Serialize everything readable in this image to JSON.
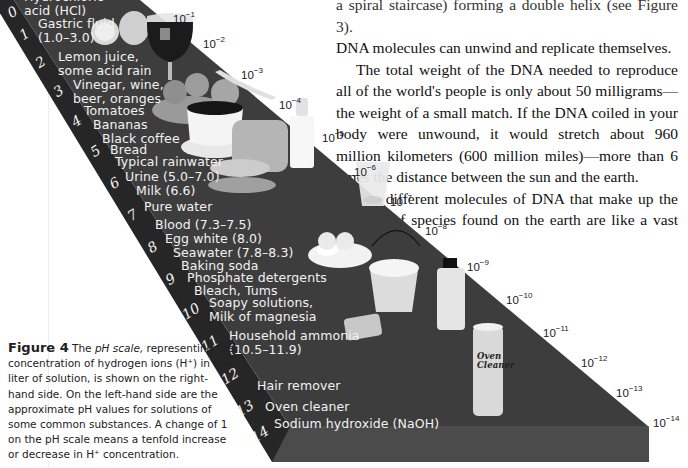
{
  "body_text": {
    "line_top_partial": "a spiral staircase) forming a double helix (see Figure 3).",
    "paragraph_1_end": "DNA molecules can unwind and replicate themselves.",
    "paragraph_2": "The total weight of the DNA needed to reproduce all of the world's people is only about 50 milligrams—the weight of a small match. If the DNA coiled in your body were unwound, it would stretch about 960 million kilometers (600 million miles)—more than 6 times the distance between the sun and the earth.",
    "paragraph_3": "The different molecules of DNA that make up the millions of species found on the earth are like a vast and diverse"
  },
  "figure": {
    "caption_label": "Figure 4",
    "caption_pre": " The ",
    "caption_term": "pH scale,",
    "caption_rest": " representing the concentration of hydrogen ions (H⁺) in one liter of solution, is shown on the right-hand side. On the left-hand side are the approximate pH values for solutions of some common substances. A change of 1 on the pH scale means a tenfold increase or decrease in H⁺ concentration.",
    "colors": {
      "top_face": "#3c3c3c",
      "side_face": "#262626",
      "front_face": "#4a4a4a",
      "label_text": "#f2f2f2"
    },
    "ph_numbers": [
      "0",
      "1",
      "2",
      "3",
      "4",
      "5",
      "6",
      "7",
      "8",
      "9",
      "10",
      "11",
      "12",
      "13",
      "14"
    ],
    "substances": [
      {
        "label": "Hydrochloric\nacid (HCl)"
      },
      {
        "label": "Gastric fluid\n(1.0–3.0)"
      },
      {
        "label": "Lemon juice,\nsome acid rain"
      },
      {
        "label": "Vinegar, wine,\nbeer, oranges"
      },
      {
        "label": "Tomatoes"
      },
      {
        "label": "Bananas"
      },
      {
        "label": "Black coffee"
      },
      {
        "label": "Bread"
      },
      {
        "label": "Typical rainwater"
      },
      {
        "label": "Urine (5.0–7.0)"
      },
      {
        "label": "Milk (6.6)"
      },
      {
        "label": "Pure water"
      },
      {
        "label": "Blood (7.3–7.5)"
      },
      {
        "label": "Egg white (8.0)"
      },
      {
        "label": "Seawater (7.8–8.3)"
      },
      {
        "label": "Baking soda"
      },
      {
        "label": "Phosphate detergents"
      },
      {
        "label": "Bleach, Tums"
      },
      {
        "label": "Soapy solutions,\nMilk of magnesia"
      },
      {
        "label": "Household ammonia\n(10.5–11.9)"
      },
      {
        "label": "Hair remover"
      },
      {
        "label": "Oven cleaner"
      },
      {
        "label": "Sodium hydroxide (NaOH)"
      }
    ],
    "concentrations": [
      {
        "base": "10",
        "exp": "−1"
      },
      {
        "base": "10",
        "exp": "−2"
      },
      {
        "base": "10",
        "exp": "−3"
      },
      {
        "base": "10",
        "exp": "−4"
      },
      {
        "base": "10",
        "exp": "−5"
      },
      {
        "base": "10",
        "exp": "−6"
      },
      {
        "base": "10",
        "exp": "−7"
      },
      {
        "base": "10",
        "exp": "−8"
      },
      {
        "base": "10",
        "exp": "−9"
      },
      {
        "base": "10",
        "exp": "−10"
      },
      {
        "base": "10",
        "exp": "−11"
      },
      {
        "base": "10",
        "exp": "−12"
      },
      {
        "base": "10",
        "exp": "−13"
      },
      {
        "base": "10",
        "exp": "−14"
      }
    ],
    "product_label": "Oven\nCleaner"
  }
}
